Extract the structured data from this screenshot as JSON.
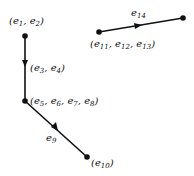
{
  "diagram": {
    "type": "directed-graph",
    "nodes": [
      {
        "id": "n1",
        "label_parts": [
          "e1",
          "e2"
        ],
        "label": "(e1, e2)",
        "x": 25,
        "y": 36
      },
      {
        "id": "n2",
        "label_parts": [
          "e5",
          "e6",
          "e7",
          "e8"
        ],
        "label": "(e5, e6, e7, e8)",
        "x": 25,
        "y": 101
      },
      {
        "id": "n3",
        "label_parts": [
          "e10"
        ],
        "label": "(e10)",
        "x": 87,
        "y": 157
      },
      {
        "id": "n4",
        "label_parts": [
          "e11",
          "e12",
          "e13"
        ],
        "label": "(e11, e12, e13)",
        "x": 99,
        "y": 32
      },
      {
        "id": "n5",
        "label": "",
        "x": 183,
        "y": 18
      }
    ],
    "edges": [
      {
        "from": "n1",
        "to": "n2",
        "label": "(e3, e4)",
        "label_parts": [
          "e3",
          "e4"
        ]
      },
      {
        "from": "n2",
        "to": "n3",
        "label": "e9",
        "label_parts": [
          "e9"
        ]
      },
      {
        "from": "n4",
        "to": "n5",
        "label": "e14",
        "label_parts": [
          "e14"
        ]
      }
    ]
  }
}
